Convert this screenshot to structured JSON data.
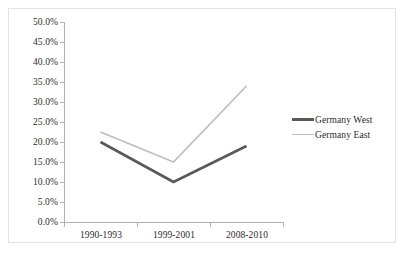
{
  "chart_data": {
    "type": "line",
    "title": "",
    "subtitle": "",
    "xlabel": "",
    "ylabel": "",
    "categories": [
      "1990-1993",
      "1999-2001",
      "2008-2010"
    ],
    "series": [
      {
        "name": "Germany West",
        "values": [
          20.0,
          10.0,
          19.0
        ],
        "color": "#595959",
        "line_width": 2.6,
        "legend_swatch": "line-swatch-dark"
      },
      {
        "name": "Germany East",
        "values": [
          22.5,
          15.0,
          34.0
        ],
        "color": "#bfbfbf",
        "line_width": 1.8,
        "legend_swatch": "line-swatch-light"
      }
    ],
    "ylim": [
      0,
      50
    ],
    "ytick_values": [
      0,
      5,
      10,
      15,
      20,
      25,
      30,
      35,
      40,
      45,
      50
    ],
    "ytick_labels": [
      "0.0%",
      "5.0%",
      "10.0%",
      "15.0%",
      "20.0%",
      "25.0%",
      "30.0%",
      "35.0%",
      "40.0%",
      "45.0%",
      "50.0%"
    ],
    "ytick_format": "percent_one_decimal",
    "grid": false,
    "legend_position": "right",
    "legend_border": false,
    "axis_color": "#b0b0b0",
    "text_color": "#2b2b2b",
    "background": "#ffffff",
    "frame_border_color": "#e3e3e3"
  },
  "legend": {
    "entries": [
      {
        "label": "Germany West"
      },
      {
        "label": "Germany East"
      }
    ]
  },
  "axes": {
    "y": {
      "labels": [
        "50.0%",
        "45.0%",
        "40.0%",
        "35.0%",
        "30.0%",
        "25.0%",
        "20.0%",
        "15.0%",
        "10.0%",
        "5.0%",
        "0.0%"
      ]
    },
    "x": {
      "labels": [
        "1990-1993",
        "1999-2001",
        "2008-2010"
      ]
    }
  }
}
